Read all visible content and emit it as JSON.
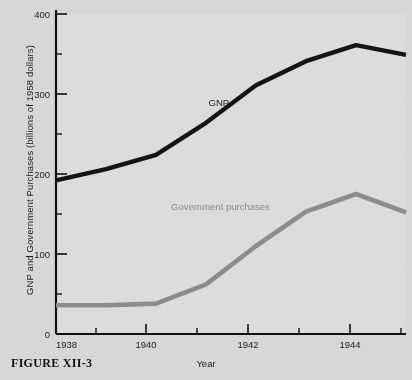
{
  "figure": {
    "caption": "FIGURE XII-3"
  },
  "chart_data": {
    "type": "line",
    "title": "",
    "xlabel": "Year",
    "ylabel": "GNP and Government Purchases (billions of 1958 dollars)",
    "xlim": [
      1938,
      1945
    ],
    "ylim": [
      0,
      400
    ],
    "xticks": [
      1938,
      1940,
      1942,
      1944
    ],
    "xtick_labels": [
      "1938",
      "1940",
      "1942",
      "1944"
    ],
    "xminorticks": [
      1939,
      1941,
      1943,
      1945
    ],
    "yticks": [
      0,
      100,
      200,
      300,
      400
    ],
    "ytick_labels": [
      "0",
      "100",
      "200",
      "300",
      "400"
    ],
    "yminorticks": [
      50,
      150,
      250,
      350
    ],
    "grid": false,
    "legend": "inline-annotations",
    "x": [
      1938,
      1939,
      1940,
      1941,
      1942,
      1943,
      1944,
      1945
    ],
    "series": [
      {
        "name": "GNP",
        "color": "#141414",
        "label_text": "GNP",
        "label_x": 1941.05,
        "label_y": 285,
        "values": [
          192,
          206,
          224,
          264,
          311,
          341,
          361,
          349
        ]
      },
      {
        "name": "Government purchases",
        "color": "#8c8c8c",
        "label_text": "Government purchases",
        "label_x": 1940.3,
        "label_y": 155,
        "values": [
          36,
          36,
          38,
          62,
          110,
          153,
          175,
          152
        ]
      }
    ]
  }
}
